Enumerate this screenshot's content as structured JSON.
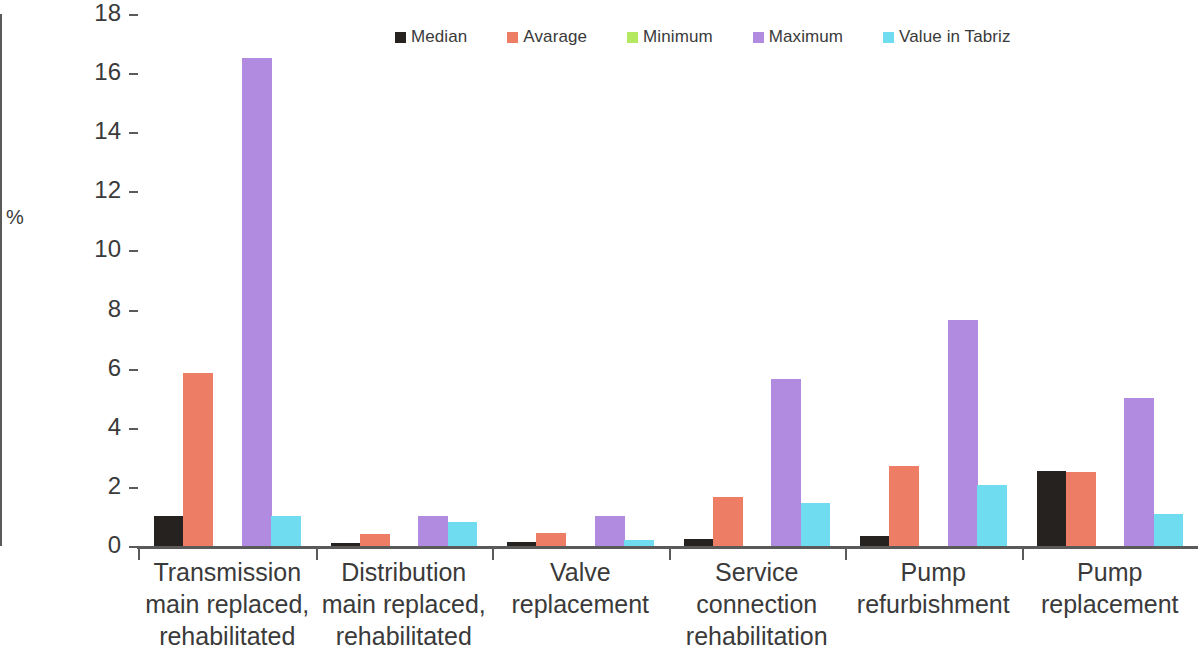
{
  "chart_data": {
    "type": "bar",
    "title": "",
    "subtitle": "",
    "xlabel": "",
    "ylabel": "%",
    "ylim": [
      0,
      18
    ],
    "ytick_labels": [
      "18",
      "16",
      "14",
      "12",
      "10",
      "8",
      "6",
      "4",
      "2",
      "0"
    ],
    "ytick_values": [
      18,
      16,
      14,
      12,
      10,
      8,
      6,
      4,
      2,
      0
    ],
    "grid": false,
    "legend_position": "top-center",
    "categories": [
      "Transmission main replaced, rehabilitated",
      "Distribution main replaced, rehabilitated",
      "Valve replacement",
      "Service connection rehabilitation",
      "Pump refurbishment",
      "Pump replacement"
    ],
    "category_lines": [
      [
        "Transmission",
        "main replaced,",
        "rehabilitated"
      ],
      [
        "Distribution",
        "main replaced,",
        "rehabilitated"
      ],
      [
        "Valve",
        "replacement",
        ""
      ],
      [
        "Service",
        "connection",
        "rehabilitation"
      ],
      [
        "Pump",
        "refurbishment",
        ""
      ],
      [
        "Pump",
        "replacement",
        ""
      ]
    ],
    "series": [
      {
        "name": "Median",
        "color": "#262220",
        "values": [
          1.0,
          0.1,
          0.15,
          0.25,
          0.35,
          2.55
        ]
      },
      {
        "name": "Avarage",
        "color": "#ED7D64",
        "values": [
          5.85,
          0.4,
          0.45,
          1.65,
          2.7,
          2.5
        ]
      },
      {
        "name": "Minimum",
        "color": "#B5E861",
        "values": [
          0,
          0,
          0,
          0,
          0,
          0
        ]
      },
      {
        "name": "Maximum",
        "color": "#B08BE0",
        "values": [
          16.5,
          1.0,
          1.0,
          5.65,
          7.65,
          5.0
        ]
      },
      {
        "name": "Value  in Tabriz",
        "color": "#6FDCEF",
        "values": [
          1.0,
          0.8,
          0.2,
          1.45,
          2.05,
          1.1
        ]
      }
    ]
  }
}
